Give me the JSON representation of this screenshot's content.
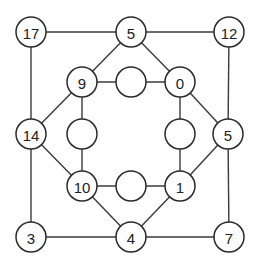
{
  "diagram": {
    "type": "graph-puzzle",
    "node_radius": 15,
    "colors": {
      "stroke": "#2a2a2a",
      "fill": "#ffffff",
      "text": "#222222"
    },
    "nodes": [
      {
        "id": "n17",
        "label": "17",
        "x": 31,
        "y": 32
      },
      {
        "id": "n5top",
        "label": "5",
        "x": 131,
        "y": 32
      },
      {
        "id": "n12",
        "label": "12",
        "x": 229,
        "y": 32
      },
      {
        "id": "n14",
        "label": "14",
        "x": 31,
        "y": 134
      },
      {
        "id": "n5right",
        "label": "5",
        "x": 228,
        "y": 134
      },
      {
        "id": "n3",
        "label": "3",
        "x": 31,
        "y": 237
      },
      {
        "id": "n4",
        "label": "4",
        "x": 131,
        "y": 237
      },
      {
        "id": "n7",
        "label": "7",
        "x": 229,
        "y": 237
      },
      {
        "id": "n9",
        "label": "9",
        "x": 82,
        "y": 82
      },
      {
        "id": "eTop",
        "label": "",
        "x": 131,
        "y": 82
      },
      {
        "id": "n0",
        "label": "0",
        "x": 180,
        "y": 82
      },
      {
        "id": "eLeft",
        "label": "",
        "x": 82,
        "y": 134
      },
      {
        "id": "eRight",
        "label": "",
        "x": 180,
        "y": 134
      },
      {
        "id": "n10",
        "label": "10",
        "x": 82,
        "y": 186
      },
      {
        "id": "eBottom",
        "label": "",
        "x": 131,
        "y": 186
      },
      {
        "id": "n1",
        "label": "1",
        "x": 180,
        "y": 186
      }
    ],
    "edges": [
      [
        "n17",
        "n5top"
      ],
      [
        "n5top",
        "n12"
      ],
      [
        "n17",
        "n14"
      ],
      [
        "n14",
        "n3"
      ],
      [
        "n12",
        "n5right"
      ],
      [
        "n5right",
        "n7"
      ],
      [
        "n3",
        "n4"
      ],
      [
        "n4",
        "n7"
      ],
      [
        "n5top",
        "n9"
      ],
      [
        "n5top",
        "n0"
      ],
      [
        "n14",
        "n9"
      ],
      [
        "n14",
        "n10"
      ],
      [
        "n5right",
        "n0"
      ],
      [
        "n5right",
        "n1"
      ],
      [
        "n4",
        "n10"
      ],
      [
        "n4",
        "n1"
      ],
      [
        "n9",
        "eTop"
      ],
      [
        "eTop",
        "n0"
      ],
      [
        "n9",
        "eLeft"
      ],
      [
        "eLeft",
        "n10"
      ],
      [
        "n0",
        "eRight"
      ],
      [
        "eRight",
        "n1"
      ],
      [
        "n10",
        "eBottom"
      ],
      [
        "eBottom",
        "n1"
      ]
    ]
  }
}
